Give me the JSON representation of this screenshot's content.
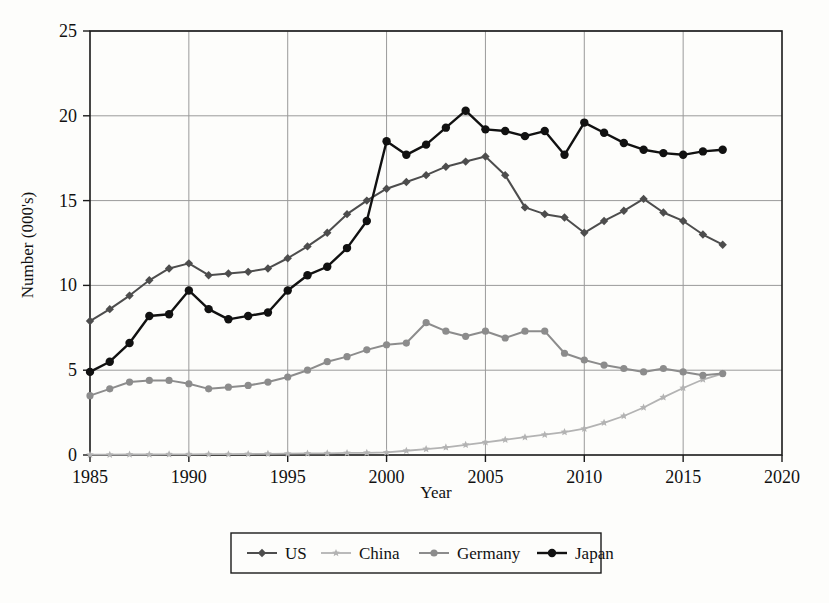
{
  "chart_data": {
    "type": "line",
    "title": "",
    "xlabel": "Year",
    "ylabel": "Number (000's)",
    "xlim": [
      1985,
      2020
    ],
    "ylim": [
      0,
      25
    ],
    "xticks": [
      1985,
      1990,
      1995,
      2000,
      2005,
      2010,
      2015,
      2020
    ],
    "yticks": [
      0,
      5,
      10,
      15,
      20,
      25
    ],
    "grid": true,
    "legend_position": "bottom",
    "x": [
      1985,
      1986,
      1987,
      1988,
      1989,
      1990,
      1991,
      1992,
      1993,
      1994,
      1995,
      1996,
      1997,
      1998,
      1999,
      2000,
      2001,
      2002,
      2003,
      2004,
      2005,
      2006,
      2007,
      2008,
      2009,
      2010,
      2011,
      2012,
      2013,
      2014,
      2015,
      2016,
      2017
    ],
    "series": [
      {
        "name": "US",
        "color": "#4d4d4d",
        "marker": "diamond",
        "values": [
          7.9,
          8.6,
          9.4,
          10.3,
          11.0,
          11.3,
          10.6,
          10.7,
          10.8,
          11.0,
          11.6,
          12.3,
          13.1,
          14.2,
          15.0,
          15.7,
          16.1,
          16.5,
          17.0,
          17.3,
          17.6,
          16.5,
          14.6,
          14.2,
          14.0,
          13.1,
          13.8,
          14.4,
          15.1,
          14.3,
          13.8,
          13.0,
          12.4
        ]
      },
      {
        "name": "China",
        "color": "#b3b3b3",
        "marker": "star",
        "values": [
          0.02,
          0.02,
          0.03,
          0.03,
          0.04,
          0.04,
          0.05,
          0.05,
          0.06,
          0.07,
          0.08,
          0.09,
          0.1,
          0.12,
          0.13,
          0.15,
          0.25,
          0.35,
          0.45,
          0.6,
          0.75,
          0.9,
          1.05,
          1.2,
          1.35,
          1.55,
          1.9,
          2.3,
          2.8,
          3.4,
          3.95,
          4.45,
          4.8
        ]
      },
      {
        "name": "Germany",
        "color": "#8c8c8c",
        "marker": "circle",
        "values": [
          3.5,
          3.9,
          4.3,
          4.4,
          4.4,
          4.2,
          3.9,
          4.0,
          4.1,
          4.3,
          4.6,
          5.0,
          5.5,
          5.8,
          6.2,
          6.5,
          6.6,
          7.8,
          7.3,
          7.0,
          7.3,
          6.9,
          7.3,
          7.3,
          6.0,
          5.6,
          5.3,
          5.1,
          4.9,
          5.1,
          4.9,
          4.7,
          4.8
        ]
      },
      {
        "name": "Japan",
        "color": "#111111",
        "marker": "circle",
        "values": [
          4.9,
          5.5,
          6.6,
          8.2,
          8.3,
          9.7,
          8.6,
          8.0,
          8.2,
          8.4,
          9.7,
          10.6,
          11.1,
          12.2,
          13.8,
          18.5,
          17.7,
          18.3,
          19.3,
          20.3,
          19.2,
          19.1,
          18.8,
          19.1,
          17.7,
          19.6,
          19.0,
          18.4,
          18.0,
          17.8,
          17.7,
          17.9,
          18.0
        ]
      }
    ]
  },
  "legend": {
    "entries": [
      {
        "label": "US"
      },
      {
        "label": "China"
      },
      {
        "label": "Germany"
      },
      {
        "label": "Japan"
      }
    ]
  }
}
